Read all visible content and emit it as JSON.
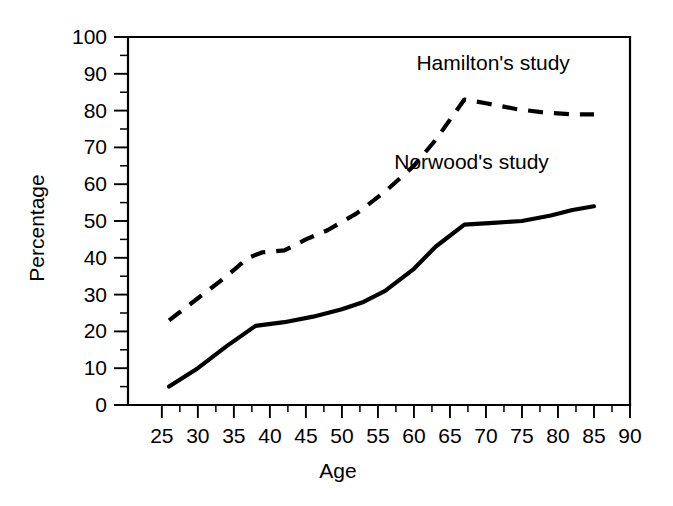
{
  "chart_data": {
    "type": "line",
    "title": "",
    "xlabel": "Age",
    "ylabel": "Percentage",
    "xlim": [
      20.3,
      90
    ],
    "ylim": [
      0,
      100
    ],
    "grid": false,
    "legend_position": "inline-annotation",
    "x_ticks": [
      25,
      30,
      35,
      40,
      45,
      50,
      55,
      60,
      65,
      70,
      75,
      80,
      85,
      90
    ],
    "x_tick_labels": [
      "25",
      "30",
      "35",
      "40",
      "45",
      "50",
      "55",
      "60",
      "65",
      "70",
      "75",
      "80",
      "85",
      "90"
    ],
    "x_minor_tick_step": 2.5,
    "y_ticks": [
      0,
      10,
      20,
      30,
      40,
      50,
      60,
      70,
      80,
      90,
      100
    ],
    "y_tick_labels": [
      "0",
      "10",
      "20",
      "30",
      "40",
      "50",
      "60",
      "70",
      "80",
      "90",
      "100"
    ],
    "y_minor_tick_step": 5,
    "series": [
      {
        "name": "Hamilton's study",
        "label": "Hamilton's study",
        "style": "dashed",
        "color": "#000000",
        "x": [
          26,
          30,
          34,
          37,
          39,
          42,
          45,
          48,
          52,
          56,
          60,
          63,
          67,
          70,
          74,
          78,
          82,
          85
        ],
        "values": [
          23,
          29,
          35,
          40,
          41.5,
          42,
          45,
          47.5,
          52,
          58,
          65,
          72,
          83,
          82,
          80.5,
          79.5,
          79,
          79
        ]
      },
      {
        "name": "Norwood's study",
        "label": "Norwood's study",
        "style": "solid",
        "color": "#000000",
        "x": [
          26,
          30,
          34,
          38,
          42,
          46,
          50,
          53,
          56,
          60,
          63,
          67,
          71,
          75,
          79,
          82,
          85
        ],
        "values": [
          5,
          10,
          16,
          21.5,
          22.5,
          24,
          26,
          28,
          31,
          37,
          43,
          49,
          49.5,
          50,
          51.5,
          53,
          54
        ]
      }
    ],
    "annotations": [
      {
        "text": "Hamilton's study",
        "x": 71,
        "y": 91
      },
      {
        "text": "Norwood's study",
        "x": 68,
        "y": 64
      }
    ]
  },
  "axes": {
    "y_axis_title": "Percentage",
    "x_axis_title": "Age"
  }
}
